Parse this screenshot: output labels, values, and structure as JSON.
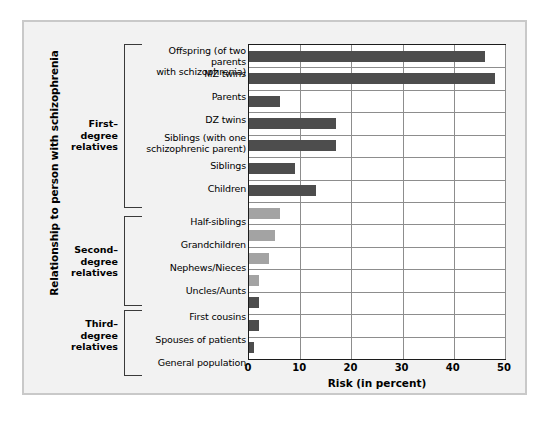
{
  "chart_data": {
    "type": "bar",
    "orientation": "horizontal",
    "title": "",
    "xlabel": "Risk (in percent)",
    "ylabel": "Relationship to person with schizophrenia",
    "xlim": [
      0,
      50
    ],
    "xticks": [
      0,
      10,
      20,
      30,
      40,
      50
    ],
    "grid": true,
    "legend": "none",
    "categories": [
      "Offspring (of two parents with schizophrenia)",
      "MZ twins",
      "Parents",
      "DZ twins",
      "Siblings (with one schizophrenic parent)",
      "Siblings",
      "Children",
      "Half-siblings",
      "Grandchildren",
      "Nephews/Nieces",
      "Uncles/Aunts",
      "First cousins",
      "Spouses  of patients",
      "General population"
    ],
    "values": [
      46,
      48,
      6,
      17,
      17,
      9,
      13,
      6,
      5,
      4,
      2,
      2,
      2,
      1
    ],
    "bar_colors": [
      "#4d4d4d",
      "#4d4d4d",
      "#4d4d4d",
      "#4d4d4d",
      "#4d4d4d",
      "#4d4d4d",
      "#4d4d4d",
      "#a3a3a3",
      "#a3a3a3",
      "#a3a3a3",
      "#a3a3a3",
      "#4d4d4d",
      "#4d4d4d",
      "#4d4d4d"
    ],
    "groups": [
      {
        "label": "First–\ndegree\nrelatives",
        "from": 0,
        "to": 6
      },
      {
        "label": "Second–\ndegree\nrelatives",
        "from": 7,
        "to": 10
      },
      {
        "label": "Third–\ndegree\nrelatives",
        "from": 11,
        "to": 13
      }
    ]
  },
  "labels": {
    "cat_0_line1": "Offspring (of two parents",
    "cat_0_line2": "with schizophrenia)",
    "cat_1": "MZ twins",
    "cat_2": "Parents",
    "cat_3": "DZ twins",
    "cat_4_line1": "Siblings (with one",
    "cat_4_line2": "schizophrenic parent)",
    "cat_5": "Siblings",
    "cat_6": "Children",
    "cat_7": "Half-siblings",
    "cat_8": "Grandchildren",
    "cat_9": "Nephews/Nieces",
    "cat_10": "Uncles/Aunts",
    "cat_11": "First cousins",
    "cat_12": "Spouses  of patients",
    "cat_13": "General population"
  },
  "groups": {
    "first_line1": "First–",
    "first_line2": "degree",
    "first_line3": "relatives",
    "second_line1": "Second–",
    "second_line2": "degree",
    "second_line3": "relatives",
    "third_line1": "Third–",
    "third_line2": "degree",
    "third_line3": "relatives"
  },
  "axes": {
    "x_title": "Risk (in percent)",
    "y_title": "Relationship to person with schizophrenia",
    "tick_0": "0",
    "tick_1": "10",
    "tick_2": "20",
    "tick_3": "30",
    "tick_4": "40",
    "tick_5": "50"
  }
}
